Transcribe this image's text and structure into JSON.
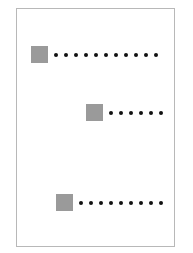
{
  "diagram": {
    "frame": {
      "border_color": "#b8b8b8",
      "background": "#ffffff"
    },
    "square_color": "#9a9a9a",
    "dot_color": "#111111",
    "rows": [
      {
        "square_x": 31,
        "square_y": 46,
        "dot_count": 11
      },
      {
        "square_x": 86,
        "square_y": 104,
        "dot_count": 6
      },
      {
        "square_x": 56,
        "square_y": 194,
        "dot_count": 9
      }
    ]
  }
}
